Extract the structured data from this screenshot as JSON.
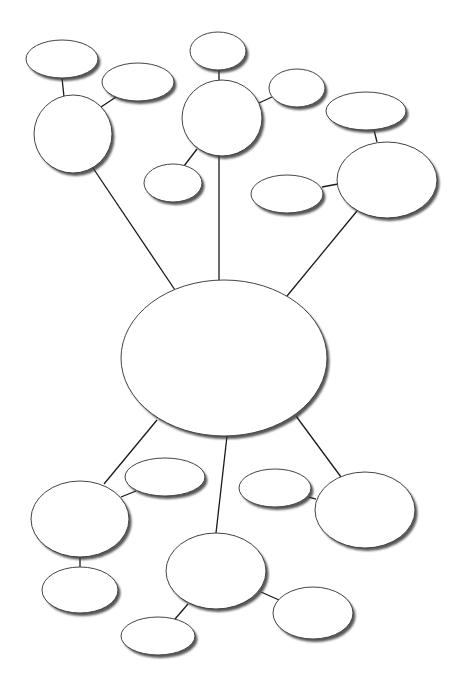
{
  "diagram": {
    "type": "bubble-map",
    "background": "#ffffff",
    "colors": {
      "node_fill": "#ffffff",
      "node_stroke": "#444444",
      "shadow": "#3a3a3a",
      "edge": "#1a1a1a"
    },
    "nodes": [
      {
        "id": "center",
        "cx": 224,
        "cy": 358,
        "rx": 103,
        "ry": 78,
        "label": ""
      },
      {
        "id": "tl-hub",
        "cx": 73,
        "cy": 134,
        "rx": 39,
        "ry": 39,
        "label": ""
      },
      {
        "id": "tl-a",
        "cx": 62,
        "cy": 59,
        "rx": 36,
        "ry": 19,
        "label": ""
      },
      {
        "id": "tl-b",
        "cx": 138,
        "cy": 82,
        "rx": 36,
        "ry": 19,
        "label": ""
      },
      {
        "id": "tc-hub",
        "cx": 222,
        "cy": 118,
        "rx": 40,
        "ry": 38,
        "label": ""
      },
      {
        "id": "tc-a",
        "cx": 218,
        "cy": 51,
        "rx": 28,
        "ry": 19,
        "label": ""
      },
      {
        "id": "tc-b",
        "cx": 297,
        "cy": 88,
        "rx": 28,
        "ry": 19,
        "label": ""
      },
      {
        "id": "tc-c",
        "cx": 173,
        "cy": 183,
        "rx": 29,
        "ry": 19,
        "label": ""
      },
      {
        "id": "tr-hub",
        "cx": 387,
        "cy": 180,
        "rx": 50,
        "ry": 38,
        "label": ""
      },
      {
        "id": "tr-a",
        "cx": 366,
        "cy": 111,
        "rx": 40,
        "ry": 19,
        "label": ""
      },
      {
        "id": "tr-b",
        "cx": 287,
        "cy": 194,
        "rx": 36,
        "ry": 19,
        "label": ""
      },
      {
        "id": "bl-hub",
        "cx": 80,
        "cy": 519,
        "rx": 49,
        "ry": 38,
        "label": ""
      },
      {
        "id": "bl-a",
        "cx": 165,
        "cy": 477,
        "rx": 40,
        "ry": 19,
        "label": ""
      },
      {
        "id": "bl-b",
        "cx": 80,
        "cy": 590,
        "rx": 38,
        "ry": 23,
        "label": ""
      },
      {
        "id": "bc-hub",
        "cx": 216,
        "cy": 571,
        "rx": 50,
        "ry": 38,
        "label": ""
      },
      {
        "id": "bc-a",
        "cx": 158,
        "cy": 636,
        "rx": 37,
        "ry": 19,
        "label": ""
      },
      {
        "id": "bc-b",
        "cx": 313,
        "cy": 613,
        "rx": 40,
        "ry": 26,
        "label": ""
      },
      {
        "id": "br-hub",
        "cx": 365,
        "cy": 510,
        "rx": 50,
        "ry": 38,
        "label": ""
      },
      {
        "id": "br-a",
        "cx": 275,
        "cy": 488,
        "rx": 36,
        "ry": 19,
        "label": ""
      }
    ],
    "edges": [
      {
        "from": "center",
        "to": "tl-hub",
        "x1": 175,
        "y1": 290,
        "x2": 93,
        "y2": 168
      },
      {
        "from": "center",
        "to": "tc-hub",
        "x1": 219,
        "y1": 280,
        "x2": 219,
        "y2": 156
      },
      {
        "from": "center",
        "to": "tr-hub",
        "x1": 287,
        "y1": 296,
        "x2": 357,
        "y2": 211
      },
      {
        "from": "center",
        "to": "bl-hub",
        "x1": 157,
        "y1": 420,
        "x2": 104,
        "y2": 484
      },
      {
        "from": "center",
        "to": "bc-hub",
        "x1": 227,
        "y1": 436,
        "x2": 216,
        "y2": 533
      },
      {
        "from": "center",
        "to": "br-hub",
        "x1": 296,
        "y1": 416,
        "x2": 341,
        "y2": 477
      },
      {
        "from": "tl-hub",
        "to": "tl-a",
        "x1": 64,
        "y1": 97,
        "x2": 62,
        "y2": 78
      },
      {
        "from": "tl-hub",
        "to": "tl-b",
        "x1": 101,
        "y1": 107,
        "x2": 116,
        "y2": 97
      },
      {
        "from": "tc-hub",
        "to": "tc-a",
        "x1": 219,
        "y1": 80,
        "x2": 219,
        "y2": 70
      },
      {
        "from": "tc-hub",
        "to": "tc-b",
        "x1": 259,
        "y1": 103,
        "x2": 272,
        "y2": 97
      },
      {
        "from": "tc-hub",
        "to": "tc-c",
        "x1": 197,
        "y1": 149,
        "x2": 184,
        "y2": 166
      },
      {
        "from": "tr-hub",
        "to": "tr-a",
        "x1": 377,
        "y1": 142,
        "x2": 374,
        "y2": 130
      },
      {
        "from": "tr-hub",
        "to": "tr-b",
        "x1": 338,
        "y1": 184,
        "x2": 322,
        "y2": 187
      },
      {
        "from": "bl-hub",
        "to": "bl-a",
        "x1": 121,
        "y1": 497,
        "x2": 136,
        "y2": 491
      },
      {
        "from": "bl-hub",
        "to": "bl-b",
        "x1": 80,
        "y1": 557,
        "x2": 80,
        "y2": 567
      },
      {
        "from": "bc-hub",
        "to": "bc-a",
        "x1": 188,
        "y1": 604,
        "x2": 175,
        "y2": 619
      },
      {
        "from": "bc-hub",
        "to": "bc-b",
        "x1": 261,
        "y1": 592,
        "x2": 279,
        "y2": 600
      },
      {
        "from": "br-hub",
        "to": "br-a",
        "x1": 316,
        "y1": 499,
        "x2": 309,
        "y2": 497
      }
    ]
  }
}
